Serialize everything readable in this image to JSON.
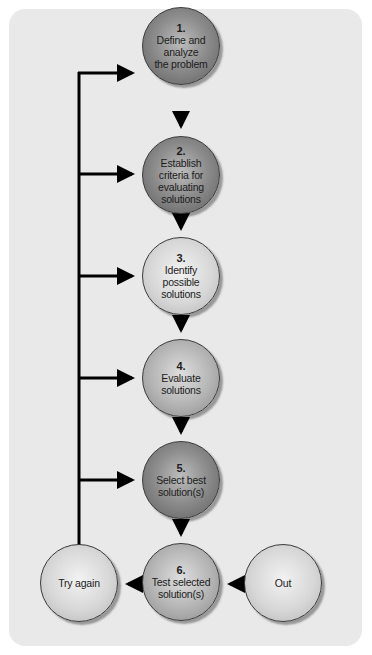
{
  "diagram": {
    "steps": [
      {
        "number": "1.",
        "label": "Define and\nanalyze\nthe problem",
        "shade": "dark"
      },
      {
        "number": "2.",
        "label": "Establish\ncriteria for\nevaluating\nsolutions",
        "shade": "dark"
      },
      {
        "number": "3.",
        "label": "Identify\npossible\nsolutions",
        "shade": "light"
      },
      {
        "number": "4.",
        "label": "Evaluate\nsolutions",
        "shade": "mid"
      },
      {
        "number": "5.",
        "label": "Select best\nsolution(s)",
        "shade": "dark"
      },
      {
        "number": "6.",
        "label": "Test selected\nsolution(s)",
        "shade": "dark"
      }
    ],
    "try_again": {
      "label": "Try again"
    },
    "out": {
      "label": "Out"
    },
    "colors": {
      "panel": "#e9e9e9",
      "line": "#000000",
      "dark_node": "#8e8e8e",
      "mid_node": "#b3b3b3",
      "light_node": "#d7d7d7"
    }
  }
}
